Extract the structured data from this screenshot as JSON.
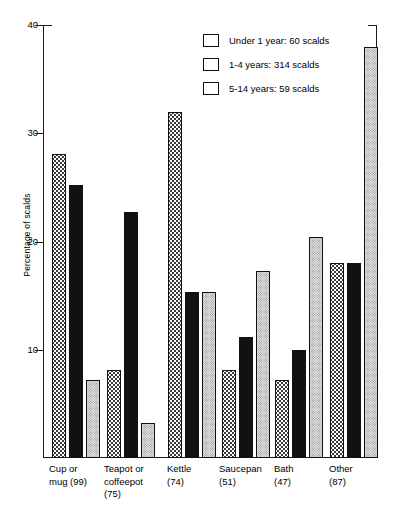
{
  "chart_data": {
    "type": "bar",
    "title": "",
    "subtitle": "",
    "xlabel": "",
    "ylabel": "Percentage of scalds",
    "ylim": [
      0,
      40
    ],
    "yticks": [
      10,
      20,
      30,
      40
    ],
    "ytick_labels": [
      "10",
      "20",
      "30",
      "40"
    ],
    "grid": false,
    "legend_position": "top-right",
    "categories": [
      "Cup or\nmug (99)",
      "Teapot or\ncoffeepot\n(75)",
      "Kettle\n(74)",
      "Saucepan\n(51)",
      "Bath\n(47)",
      "Other\n(87)"
    ],
    "series": [
      {
        "name": "Under 1 year: 60 scalds",
        "pattern": "open-dots",
        "values": [
          28.1,
          8.1,
          32.0,
          8.1,
          7.2,
          18.0
        ]
      },
      {
        "name": "1-4 years: 314 scalds",
        "pattern": "solid-black",
        "values": [
          25.2,
          22.7,
          15.3,
          11.2,
          10.0,
          18.0
        ]
      },
      {
        "name": "5-14 years: 59 scalds",
        "pattern": "grey-stipple",
        "values": [
          7.2,
          3.2,
          15.3,
          17.3,
          20.4,
          38.0
        ]
      }
    ]
  },
  "axis": {
    "y_title": "Percentage of scalds",
    "tick_40": "40",
    "tick_30": "30",
    "tick_20": "20",
    "tick_10": "10"
  },
  "legend": {
    "items": [
      {
        "label": "Under 1 year: 60 scalds"
      },
      {
        "label": "1-4 years: 314 scalds"
      },
      {
        "label": "5-14 years: 59 scalds"
      }
    ]
  },
  "x_labels": [
    "Cup or\nmug (99)",
    "Teapot or\ncoffeepot\n(75)",
    "Kettle\n(74)",
    "Saucepan\n(51)",
    "Bath\n(47)",
    "Other\n(87)"
  ],
  "colors": {
    "ink": "#111111",
    "series_black": "#111111",
    "series_grey": "#dcdcdc",
    "series_open": "#fdfdfd"
  }
}
